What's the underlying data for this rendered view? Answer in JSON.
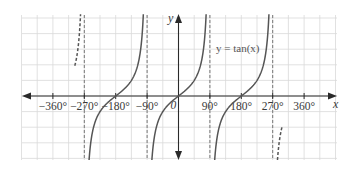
{
  "chart_data": {
    "type": "line",
    "title": "",
    "function_label": "y = tan(x)",
    "xlabel": "x",
    "ylabel": "y",
    "xlim": [
      -450,
      450
    ],
    "x_tick_labels": [
      "−360°",
      "−270°",
      "−180°",
      "−90°",
      "0",
      "90°",
      "180°",
      "270°",
      "360°"
    ],
    "x_ticks": [
      -360,
      -270,
      -180,
      -90,
      0,
      90,
      180,
      270,
      360
    ],
    "origin_label": "0",
    "asymptotes": [
      -270,
      -90,
      90,
      270
    ],
    "grid": true,
    "series": [
      {
        "name": "tan(x) solid branch 1",
        "style": "solid",
        "x_range": [
          -270,
          -90
        ]
      },
      {
        "name": "tan(x) solid branch 2",
        "style": "solid",
        "x_range": [
          -90,
          90
        ]
      },
      {
        "name": "tan(x) solid branch 3",
        "style": "solid",
        "x_range": [
          90,
          270
        ]
      },
      {
        "name": "tan(x) dashed partial left",
        "style": "dashed",
        "x_range": [
          -315,
          -270
        ]
      },
      {
        "name": "tan(x) dashed partial right",
        "style": "dashed",
        "x_range": [
          270,
          315
        ]
      }
    ],
    "colors": {
      "curve": "#555555",
      "asymptote": "#777777",
      "grid": "#d9d9d9",
      "axis": "#2a2a2a"
    }
  }
}
